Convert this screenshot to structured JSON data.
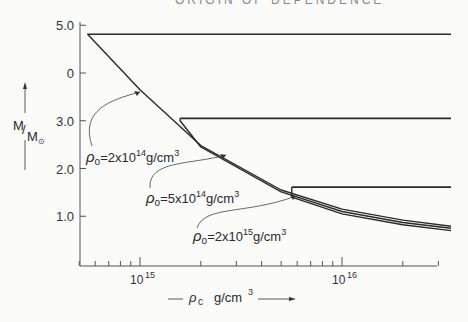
{
  "header": {
    "text": "ORIGIN OF DEPENDENCE"
  },
  "chart_data": {
    "type": "line",
    "title": "",
    "xlabel": "ρc g/cm³",
    "ylabel": "M/M⊙",
    "xscale": "log",
    "xlim": [
      500000000000000.0,
      3.5e+16
    ],
    "ylim": [
      0,
      5.0
    ],
    "grid": false,
    "y_ticks": [
      {
        "value": 5.0,
        "label": "5.0"
      },
      {
        "value": 4.0,
        "label": "0"
      },
      {
        "value": 3.0,
        "label": "3.0"
      },
      {
        "value": 2.0,
        "label": "2.0"
      },
      {
        "value": 1.0,
        "label": "1.0"
      }
    ],
    "x_ticks": [
      {
        "value": 1000000000000000.0,
        "label": "10",
        "exp": "15"
      },
      {
        "value": 1e+16,
        "label": "10",
        "exp": "16"
      }
    ],
    "series": [
      {
        "name": "ρ0=2x10^14 g/cm^3",
        "label_base": "ρ",
        "label_sub": "o",
        "label_mid": "=2x10",
        "label_exp": "14",
        "label_unit": "g/cm",
        "label_unit_exp": "3",
        "plateau": {
          "M": 4.81,
          "from_rho": 550000000000000.0,
          "to_rho": 3.5e+16
        },
        "x": [
          550000000000000.0,
          1000000000000000.0,
          2000000000000000.0,
          5000000000000000.0,
          1e+16,
          2e+16,
          3.5e+16
        ],
        "y": [
          4.81,
          3.65,
          2.48,
          1.55,
          1.15,
          0.92,
          0.79
        ]
      },
      {
        "name": "ρ0=5x10^14 g/cm^3",
        "label_base": "ρ",
        "label_sub": "o",
        "label_mid": "=5x10",
        "label_exp": "14",
        "label_unit": "g/cm",
        "label_unit_exp": "3",
        "plateau": {
          "M": 3.05,
          "from_rho": 1580000000000000.0,
          "to_rho": 3.5e+16
        },
        "x": [
          1580000000000000.0,
          2000000000000000.0,
          5000000000000000.0,
          1e+16,
          2e+16,
          3.5e+16
        ],
        "y": [
          3.0,
          2.45,
          1.51,
          1.1,
          0.87,
          0.75
        ]
      },
      {
        "name": "ρ0=2x10^15 g/cm^3",
        "label_base": "ρ",
        "label_sub": "o",
        "label_mid": "=2x10",
        "label_exp": "15",
        "label_unit": "g/cm",
        "label_unit_exp": "3",
        "plateau": {
          "M": 1.61,
          "from_rho": 5640000000000000.0,
          "to_rho": 3.5e+16
        },
        "x": [
          5640000000000000.0,
          1e+16,
          2e+16,
          3.5e+16
        ],
        "y": [
          1.4,
          1.05,
          0.82,
          0.7
        ]
      }
    ],
    "annotations": [
      "ρo=2x10^14 g/cm^3",
      "ρo=5x10^14 g/cm^3",
      "ρo=2x10^15 g/cm^3"
    ]
  },
  "axis": {
    "ylabel_main": "M",
    "ylabel_sub": "M",
    "ylabel_sun": "⊙",
    "xlabel_rho": "ρ",
    "xlabel_sub": "c",
    "xlabel_unit": "g/cm",
    "xlabel_exp": "3"
  }
}
